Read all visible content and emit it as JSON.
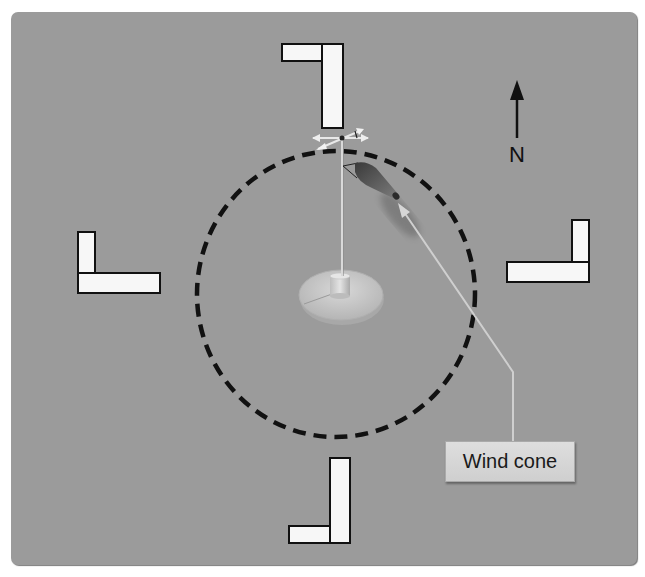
{
  "figure": {
    "background_color": "#9b9b9b"
  },
  "north_indicator": {
    "label": "N",
    "icon": "north-arrow-icon"
  },
  "callout": {
    "label": "Wind cone",
    "target": "windsock"
  },
  "segmented_circle": {
    "style": "dashed",
    "color": "#111111"
  },
  "traffic_pattern_indicators": [
    {
      "position": "top",
      "shape": "L"
    },
    {
      "position": "left",
      "shape": "L"
    },
    {
      "position": "right",
      "shape": "L"
    },
    {
      "position": "bottom",
      "shape": "L"
    }
  ],
  "wind_indicators": [
    {
      "name": "wind-cone",
      "icon": "windsock-icon"
    },
    {
      "name": "wind-tee",
      "icon": "wind-tee-icon"
    },
    {
      "name": "base",
      "icon": "mast-base-icon"
    }
  ]
}
